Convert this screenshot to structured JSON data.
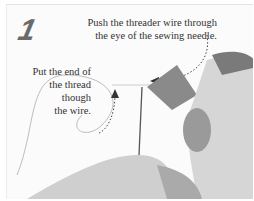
{
  "figure": {
    "step_number": "1",
    "captions": [
      {
        "lines": [
          "Push the threader wire through",
          "the eye of the sewing needle."
        ]
      },
      {
        "lines": [
          "Put the end of",
          "the thread",
          "though",
          "the wire."
        ]
      }
    ],
    "colors": {
      "background": "#fbfbfb",
      "text": "#333333",
      "step_number": "#6a6a6a"
    }
  }
}
